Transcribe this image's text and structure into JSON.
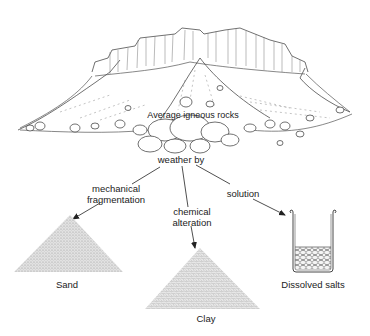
{
  "diagram": {
    "source_label": "Average igneous rocks",
    "process_label": "weather by",
    "branches": [
      {
        "process": [
          "mechanical",
          "fragmentation"
        ],
        "product": "Sand"
      },
      {
        "process": [
          "chemical",
          "alteration"
        ],
        "product": "Clay"
      },
      {
        "process": [
          "solution"
        ],
        "product": "Dissolved salts"
      }
    ]
  },
  "colors": {
    "line": "#222222",
    "sand_fill": "#d6d6d6",
    "clay_fill": "#cfcfcf",
    "background": "#ffffff"
  }
}
